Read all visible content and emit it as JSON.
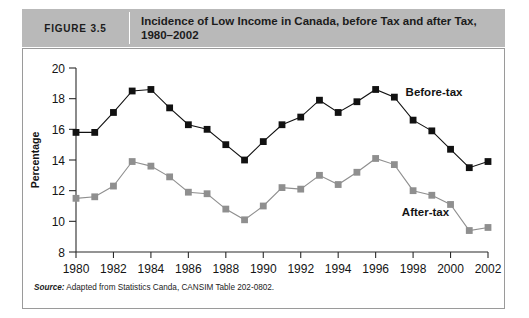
{
  "header": {
    "figure_label": "FIGURE 3.5",
    "title": "Incidence of Low Income in Canada, before Tax and after Tax, 1980–2002",
    "band_color": "#b9b9b9"
  },
  "source": {
    "prefix": "Source:",
    "text": " Adapted from Statistics Canda, CANSIM Table 202-0802."
  },
  "chart_data": {
    "type": "line",
    "title": "Incidence of Low Income in Canada, before Tax and after Tax, 1980–2002",
    "xlabel": "",
    "ylabel": "Percentage",
    "x": [
      1980,
      1981,
      1982,
      1983,
      1984,
      1985,
      1986,
      1987,
      1988,
      1989,
      1990,
      1991,
      1992,
      1993,
      1994,
      1995,
      1996,
      1997,
      1998,
      1999,
      2000,
      2001,
      2002
    ],
    "xticks": [
      1980,
      1982,
      1984,
      1986,
      1988,
      1990,
      1992,
      1994,
      1996,
      1998,
      2000,
      2002
    ],
    "xtick_labels": [
      "1980",
      "1982",
      "1984",
      "1986",
      "1988",
      "1990",
      "1992",
      "1994",
      "1996",
      "1998",
      "2000",
      "2002"
    ],
    "xlim": [
      1980,
      2002
    ],
    "yticks": [
      8,
      10,
      12,
      14,
      16,
      18,
      20
    ],
    "ytick_labels": [
      "8",
      "10",
      "12",
      "14",
      "16",
      "18",
      "20"
    ],
    "ylim": [
      8,
      20
    ],
    "grid": false,
    "legend_position": "inline-labels",
    "series": [
      {
        "name": "Before-tax",
        "color": "#111111",
        "marker": "square",
        "values": [
          15.8,
          15.8,
          17.1,
          18.5,
          18.6,
          17.4,
          16.3,
          16.0,
          15.0,
          14.0,
          15.2,
          16.3,
          16.8,
          17.9,
          17.1,
          17.8,
          18.6,
          18.1,
          16.6,
          15.9,
          14.7,
          13.5,
          13.9
        ]
      },
      {
        "name": "After-tax",
        "color": "#8f8f8f",
        "marker": "square",
        "values": [
          11.5,
          11.6,
          12.3,
          13.9,
          13.6,
          12.9,
          11.9,
          11.8,
          10.8,
          10.1,
          11.0,
          12.2,
          12.1,
          13.0,
          12.4,
          13.2,
          14.1,
          13.7,
          12.0,
          11.7,
          11.1,
          9.4,
          9.6
        ]
      }
    ],
    "annotations": [
      {
        "name": "before-tax-label",
        "text": "Before-tax",
        "x": 1997.6,
        "y": 18.2
      },
      {
        "name": "after-tax-label",
        "text": "After-tax",
        "x": 1997.4,
        "y": 10.35
      }
    ]
  }
}
